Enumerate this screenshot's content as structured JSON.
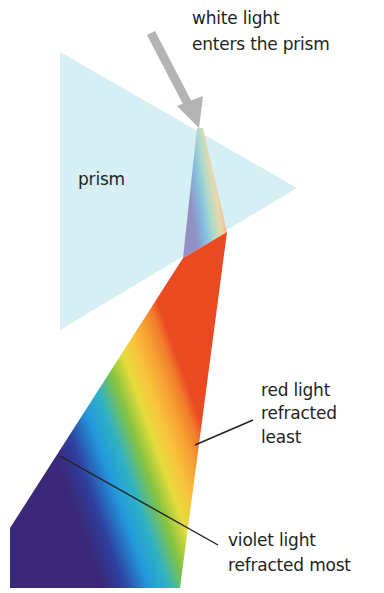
{
  "labels": {
    "white_light": [
      "white light",
      "enters the prism"
    ],
    "prism": "prism",
    "red_light": [
      "red light",
      "refracted",
      "least"
    ],
    "violet_light": [
      "violet light",
      "refracted most"
    ]
  },
  "colors": {
    "prism_fill": "#d6eff4",
    "arrow": "#b4b4b4",
    "text": "#231f20",
    "leader_line": "#231f20",
    "spectrum": [
      "#3a2a7a",
      "#2d4fb0",
      "#2a9fe0",
      "#34b4c8",
      "#7cc242",
      "#d8d93a",
      "#f8c43a",
      "#f7a233",
      "#f27a2a",
      "#ec4e23"
    ]
  }
}
